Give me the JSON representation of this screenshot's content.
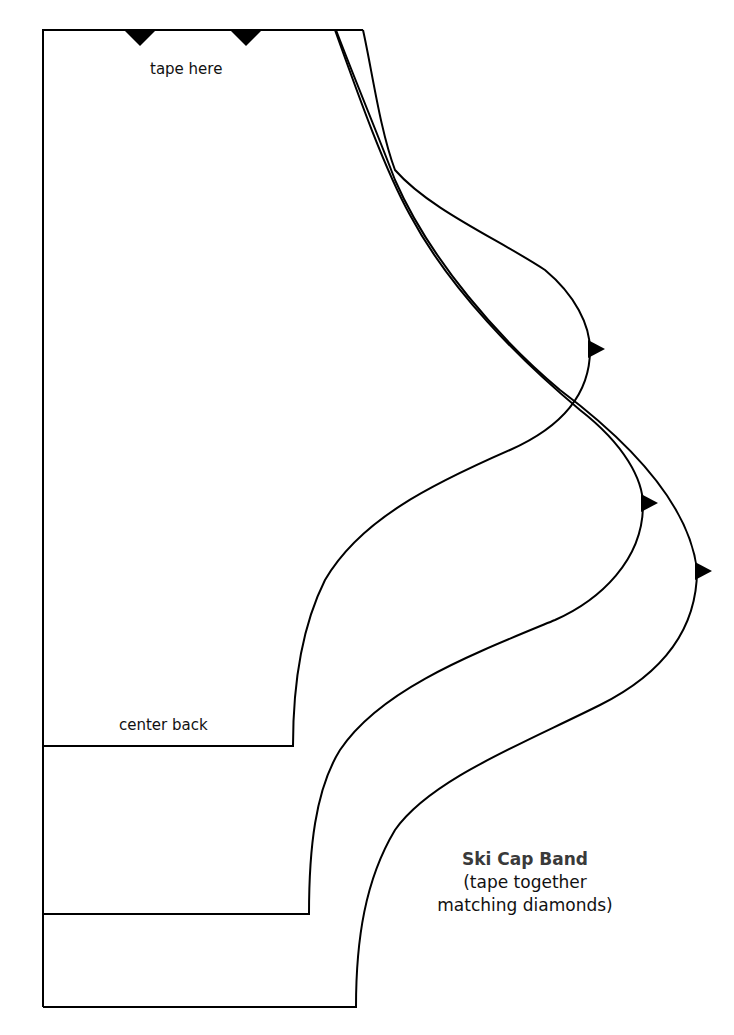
{
  "diagram": {
    "type": "sewing-pattern",
    "title": "Ski Cap Band",
    "subtitle_lines": [
      "(tape together",
      "matching diamonds)"
    ],
    "labels": {
      "top": "tape here",
      "fold": "center back"
    },
    "sizes": [
      {
        "name": "size-small",
        "bottom_y": 746,
        "bottom_right_x": 293,
        "notch": [
          590,
          348
        ]
      },
      {
        "name": "size-medium",
        "bottom_y": 914,
        "bottom_right_x": 309,
        "notch": [
          643,
          503
        ]
      },
      {
        "name": "size-large",
        "bottom_y": 1007,
        "bottom_right_x": 356,
        "notch": [
          697,
          571
        ]
      }
    ],
    "top_notches": [
      [
        140,
        31
      ],
      [
        246,
        31
      ]
    ],
    "colors": {
      "line": "#000000",
      "background": "#ffffff",
      "title": "#3a3a3a"
    }
  }
}
